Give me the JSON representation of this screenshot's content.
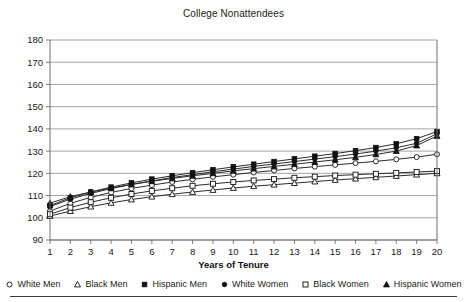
{
  "chart_data": {
    "type": "line",
    "title": "College Nonattendees",
    "xlabel": "Years of Tenure",
    "ylabel": "",
    "grid": true,
    "legend_position": "bottom",
    "xlim": [
      1,
      20
    ],
    "ylim": [
      90,
      180
    ],
    "yticks": [
      90,
      100,
      110,
      120,
      130,
      140,
      150,
      160,
      170,
      180
    ],
    "x": [
      1,
      2,
      3,
      4,
      5,
      6,
      7,
      8,
      9,
      10,
      11,
      12,
      13,
      14,
      15,
      16,
      17,
      18,
      19,
      20
    ],
    "categories": [
      "1",
      "2",
      "3",
      "4",
      "5",
      "6",
      "7",
      "8",
      "9",
      "10",
      "11",
      "12",
      "13",
      "14",
      "15",
      "16",
      "17",
      "18",
      "19",
      "20"
    ],
    "series": [
      {
        "name": "White Men",
        "marker": "open-circle",
        "values": [
          103.0,
          106.5,
          109.2,
          111.4,
          113.2,
          114.7,
          116.1,
          117.3,
          118.4,
          119.4,
          120.4,
          121.3,
          122.2,
          123.0,
          123.8,
          124.6,
          125.4,
          126.3,
          127.3,
          128.6
        ]
      },
      {
        "name": "Black Men",
        "marker": "open-triangle",
        "values": [
          100.8,
          103.0,
          105.0,
          106.7,
          108.2,
          109.5,
          110.6,
          111.6,
          112.5,
          113.4,
          114.2,
          114.9,
          115.6,
          116.3,
          117.0,
          117.6,
          118.2,
          118.8,
          119.4,
          120.0
        ]
      },
      {
        "name": "Hispanic Men",
        "marker": "filled-square",
        "values": [
          105.5,
          109.0,
          111.6,
          113.8,
          115.7,
          117.4,
          118.9,
          120.3,
          121.6,
          122.9,
          124.1,
          125.3,
          126.5,
          127.7,
          128.9,
          130.2,
          131.6,
          133.3,
          135.6,
          138.8
        ]
      },
      {
        "name": "White Women",
        "marker": "filled-circle",
        "values": [
          105.0,
          108.4,
          111.0,
          113.1,
          115.0,
          116.6,
          118.1,
          119.4,
          120.7,
          121.9,
          123.1,
          124.2,
          125.3,
          126.4,
          127.5,
          128.7,
          130.0,
          131.5,
          133.5,
          137.8
        ]
      },
      {
        "name": "Black Women",
        "marker": "open-square",
        "values": [
          101.6,
          104.6,
          107.0,
          109.0,
          110.7,
          112.1,
          113.3,
          114.4,
          115.3,
          116.1,
          116.8,
          117.4,
          118.0,
          118.5,
          119.0,
          119.4,
          119.8,
          120.2,
          120.6,
          121.0
        ]
      },
      {
        "name": "Hispanic Women",
        "marker": "filled-triangle",
        "values": [
          106.6,
          109.5,
          111.6,
          113.4,
          115.0,
          116.4,
          117.7,
          118.9,
          120.0,
          121.1,
          122.1,
          123.1,
          124.1,
          125.1,
          126.1,
          127.2,
          128.5,
          130.0,
          132.5,
          136.8
        ]
      }
    ]
  },
  "colors": {
    "line": "#2b2b2b",
    "grid": "#8c8c8c",
    "axis": "#6e6e6e",
    "text": "#1a1a1a"
  }
}
